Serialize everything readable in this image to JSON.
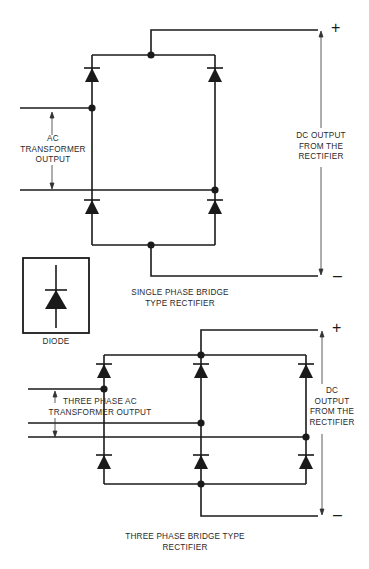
{
  "single_phase": {
    "ac_label": [
      "AC",
      "TRANSFORMER",
      "OUTPUT"
    ],
    "dc_label": [
      "DC OUTPUT",
      "FROM THE",
      "RECTIFIER"
    ],
    "title": [
      "SINGLE PHASE BRIDGE",
      "TYPE RECTIFIER"
    ],
    "plus": "+",
    "minus": "–"
  },
  "legend": {
    "symbol": "diode-icon",
    "label": "DIODE"
  },
  "three_phase": {
    "ac_label": [
      "THREE PHASE AC",
      "TRANSFORMER OUTPUT"
    ],
    "dc_label": [
      "DC",
      "OUTPUT",
      "FROM THE",
      "RECTIFIER"
    ],
    "title": [
      "THREE PHASE BRIDGE TYPE",
      "RECTIFIER"
    ],
    "plus": "+",
    "minus": "–"
  },
  "colors": {
    "line": "#1a1a1a",
    "background": "#ffffff"
  }
}
